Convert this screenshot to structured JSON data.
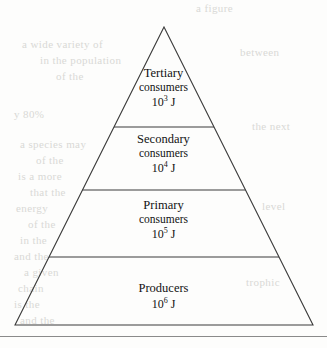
{
  "figure": {
    "type": "energy-pyramid",
    "apex": {
      "x": 164,
      "y": 27
    },
    "base_left": {
      "x": 15,
      "y": 325
    },
    "base_right": {
      "x": 313,
      "y": 325
    },
    "outline_color": "#3a3a3a",
    "background_color": "#fdfdfc",
    "text_color": "#121212",
    "rule_color": "#8a8a8a"
  },
  "tiers": [
    {
      "name_main": "Tertiary",
      "name_sub": "consumers",
      "energy_base": "10",
      "energy_exponent": "3",
      "energy_unit": " J",
      "divider_y": 127
    },
    {
      "name_main": "Secondary",
      "name_sub": "consumers",
      "energy_base": "10",
      "energy_exponent": "4",
      "energy_unit": " J",
      "divider_y": 190
    },
    {
      "name_main": "Primary",
      "name_sub": "consumers",
      "energy_base": "10",
      "energy_exponent": "5",
      "energy_unit": " J",
      "divider_y": 257
    },
    {
      "name_main": "Producers",
      "name_sub": "",
      "energy_base": "10",
      "energy_exponent": "6",
      "energy_unit": " J",
      "divider_y": null
    }
  ],
  "ghost_text": [
    {
      "text": "a figure",
      "x": 196,
      "y": 2
    },
    {
      "text": "a wide variety of",
      "x": 22,
      "y": 38
    },
    {
      "text": "in the population",
      "x": 40,
      "y": 54
    },
    {
      "text": "of the",
      "x": 56,
      "y": 70
    },
    {
      "text": "y 80%",
      "x": 14,
      "y": 108
    },
    {
      "text": "a species may",
      "x": 20,
      "y": 138
    },
    {
      "text": "of the",
      "x": 36,
      "y": 154
    },
    {
      "text": "is a more",
      "x": 18,
      "y": 170
    },
    {
      "text": "that the",
      "x": 30,
      "y": 186
    },
    {
      "text": "energy",
      "x": 16,
      "y": 202
    },
    {
      "text": "of the",
      "x": 28,
      "y": 218
    },
    {
      "text": "in the",
      "x": 20,
      "y": 234
    },
    {
      "text": "and the",
      "x": 14,
      "y": 250
    },
    {
      "text": "a given",
      "x": 24,
      "y": 266
    },
    {
      "text": "chain",
      "x": 18,
      "y": 282
    },
    {
      "text": "is the",
      "x": 14,
      "y": 298
    },
    {
      "text": "and the",
      "x": 20,
      "y": 314
    },
    {
      "text": "between",
      "x": 240,
      "y": 46
    },
    {
      "text": "the next",
      "x": 252,
      "y": 120
    },
    {
      "text": "level",
      "x": 262,
      "y": 200
    },
    {
      "text": "trophic",
      "x": 246,
      "y": 276
    }
  ]
}
